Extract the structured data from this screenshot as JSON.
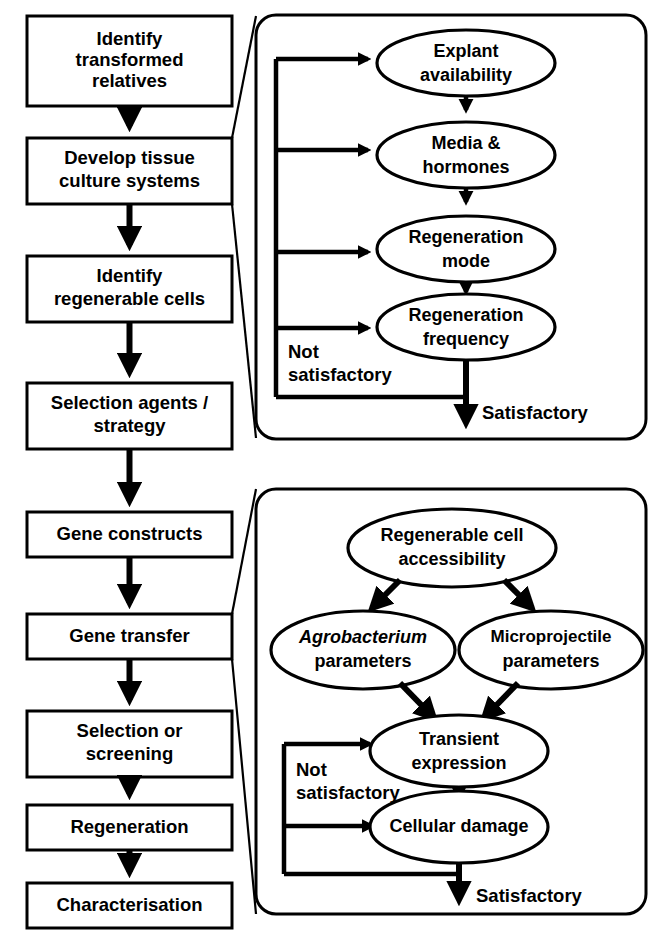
{
  "diagram": {
    "colors": {
      "stroke": "#000000",
      "fill": "#ffffff",
      "background": "#ffffff"
    },
    "pipeline": {
      "name": "main-pipeline",
      "steps": [
        {
          "id": "identify-transformed-relatives",
          "lines": [
            "Identify",
            "transformed",
            "relatives"
          ]
        },
        {
          "id": "develop-tissue-culture-systems",
          "lines": [
            "Develop tissue",
            "culture systems"
          ]
        },
        {
          "id": "identify-regenerable-cells",
          "lines": [
            "Identify",
            "regenerable cells"
          ]
        },
        {
          "id": "selection-agents-strategy",
          "lines": [
            "Selection agents /",
            "strategy"
          ]
        },
        {
          "id": "gene-constructs",
          "lines": [
            "Gene constructs"
          ]
        },
        {
          "id": "gene-transfer",
          "lines": [
            "Gene transfer"
          ]
        },
        {
          "id": "selection-or-screening",
          "lines": [
            "Selection or",
            "screening"
          ]
        },
        {
          "id": "regeneration",
          "lines": [
            "Regeneration"
          ]
        },
        {
          "id": "characterisation",
          "lines": [
            "Characterisation"
          ]
        }
      ]
    },
    "panel_tissue_culture": {
      "name": "tissue-culture-detail-panel",
      "source_step": "develop-tissue-culture-systems",
      "nodes": [
        {
          "id": "explant-availability",
          "lines": [
            "Explant",
            "availability"
          ]
        },
        {
          "id": "media-and-hormones",
          "lines": [
            "Media &",
            "hormones"
          ]
        },
        {
          "id": "regeneration-mode",
          "lines": [
            "Regeneration",
            "mode"
          ]
        },
        {
          "id": "regeneration-frequency",
          "lines": [
            "Regeneration",
            "frequency"
          ]
        }
      ],
      "loop_label": [
        "Not",
        "satisfactory"
      ],
      "exit_label": "Satisfactory"
    },
    "panel_gene_transfer": {
      "name": "gene-transfer-detail-panel",
      "source_step": "gene-transfer",
      "nodes": [
        {
          "id": "regenerable-cell-accessibility",
          "lines": [
            "Regenerable cell",
            "accessibility"
          ]
        },
        {
          "id": "agrobacterium-parameters",
          "lines": [
            "Agrobacterium",
            "parameters"
          ],
          "italic_line": 0
        },
        {
          "id": "microprojectile-parameters",
          "lines": [
            "Microprojectile",
            "parameters"
          ]
        },
        {
          "id": "transient-expression",
          "lines": [
            "Transient",
            "expression"
          ]
        },
        {
          "id": "cellular-damage",
          "lines": [
            "Cellular damage"
          ]
        }
      ],
      "loop_label": [
        "Not",
        "satisfactory"
      ],
      "exit_label": "Satisfactory"
    }
  }
}
